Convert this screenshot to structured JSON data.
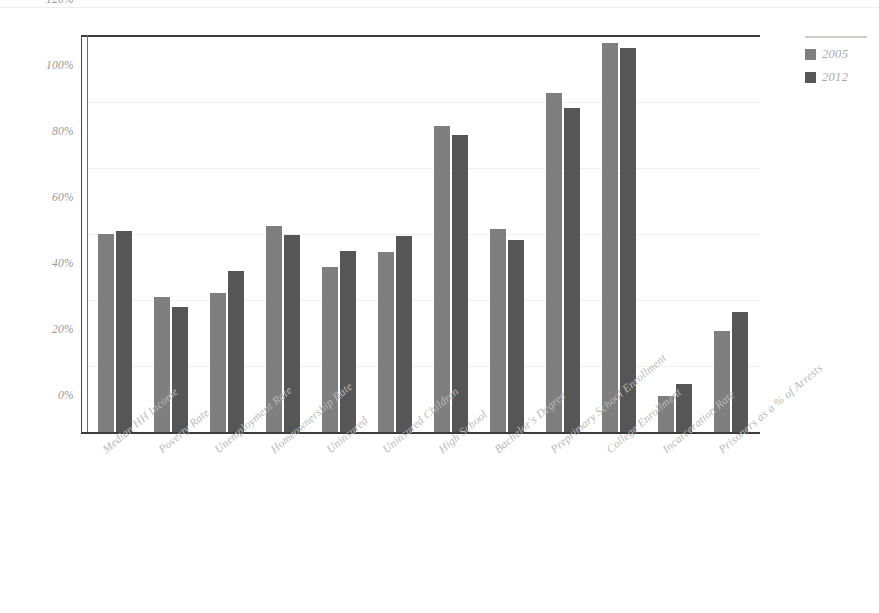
{
  "chart_data": {
    "type": "bar",
    "title": "",
    "subtitle": "",
    "xlabel": "",
    "ylabel": "",
    "ylim": [
      0,
      120
    ],
    "yticks": [
      "0%",
      "20%",
      "40%",
      "60%",
      "80%",
      "100%",
      "120%"
    ],
    "ytick_values": [
      0,
      20,
      40,
      60,
      80,
      100,
      120
    ],
    "grid": true,
    "legend_position": "right",
    "categories": [
      "Median HH Income",
      "Poverty Rate",
      "Unemployment Rate",
      "Homeownership Rate",
      "Uninsured",
      "Uninsured Children",
      "High School",
      "Bachelor's Degree",
      "Preprimary School Enrollment",
      "College Enrollment",
      "Incarceration Rate",
      "Prisoners as a % of Arrests"
    ],
    "series": [
      {
        "name": "2005",
        "color": "#7f7f7f",
        "values": [
          60,
          41,
          42,
          62.5,
          50,
          54.5,
          92.8,
          61.5,
          102.8,
          118,
          11,
          30.5
        ]
      },
      {
        "name": "2012",
        "color": "#565656",
        "values": [
          60.8,
          38,
          48.8,
          59.8,
          55,
          59.5,
          90,
          58.3,
          98.3,
          116.5,
          14.5,
          36.5
        ]
      }
    ]
  },
  "legend": {
    "items": [
      {
        "label": "2005",
        "color": "#7f7f7f"
      },
      {
        "label": "2012",
        "color": "#565656"
      }
    ]
  },
  "axis": {
    "y_tick_labels": [
      "120%",
      "100%",
      "80%",
      "60%",
      "40%",
      "20%",
      "0%"
    ]
  }
}
